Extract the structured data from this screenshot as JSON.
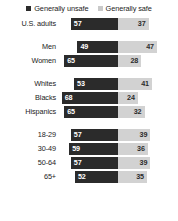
{
  "legend": {
    "items": [
      {
        "label": "Generally unsafe",
        "color": "#2b2b2b",
        "icon": "square-marker-icon"
      },
      {
        "label": "Generally safe",
        "color": "#c9c9c9",
        "icon": "square-marker-icon"
      }
    ]
  },
  "chart_data": {
    "type": "bar",
    "title": "",
    "subtitle": "",
    "xlabel": "",
    "ylabel": "",
    "orientation": "horizontal",
    "layout": "diverging-centered",
    "grid": false,
    "legend_position": "top-center",
    "axis_max": 70,
    "categories": [
      "U.S. adults",
      "Men",
      "Women",
      "Whites",
      "Blacks",
      "Hispanics",
      "18-29",
      "30-49",
      "50-64",
      "65+"
    ],
    "series": [
      {
        "name": "Generally unsafe",
        "color": "#2b2b2b",
        "values": [
          57,
          49,
          65,
          53,
          68,
          65,
          57,
          59,
          57,
          52
        ]
      },
      {
        "name": "Generally safe",
        "color": "#d2d2d2",
        "values": [
          37,
          47,
          28,
          41,
          24,
          32,
          39,
          36,
          39,
          35
        ]
      }
    ],
    "groups": [
      {
        "name": "total",
        "categories": [
          "U.S. adults"
        ]
      },
      {
        "name": "gender",
        "categories": [
          "Men",
          "Women"
        ]
      },
      {
        "name": "race",
        "categories": [
          "Whites",
          "Blacks",
          "Hispanics"
        ]
      },
      {
        "name": "age",
        "categories": [
          "18-29",
          "30-49",
          "50-64",
          "65+"
        ]
      }
    ]
  },
  "rows": [
    {
      "label": "U.S. adults",
      "unsafe": 57,
      "safe": 37,
      "group": 0
    },
    {
      "label": "Men",
      "unsafe": 49,
      "safe": 47,
      "group": 1
    },
    {
      "label": "Women",
      "unsafe": 65,
      "safe": 28,
      "group": 1
    },
    {
      "label": "Whites",
      "unsafe": 53,
      "safe": 41,
      "group": 2
    },
    {
      "label": "Blacks",
      "unsafe": 68,
      "safe": 24,
      "group": 2
    },
    {
      "label": "Hispanics",
      "unsafe": 65,
      "safe": 32,
      "group": 2
    },
    {
      "label": "18-29",
      "unsafe": 57,
      "safe": 39,
      "group": 3
    },
    {
      "label": "30-49",
      "unsafe": 59,
      "safe": 36,
      "group": 3
    },
    {
      "label": "50-64",
      "unsafe": 57,
      "safe": 39,
      "group": 3
    },
    {
      "label": "65+",
      "unsafe": 52,
      "safe": 35,
      "group": 3
    }
  ]
}
